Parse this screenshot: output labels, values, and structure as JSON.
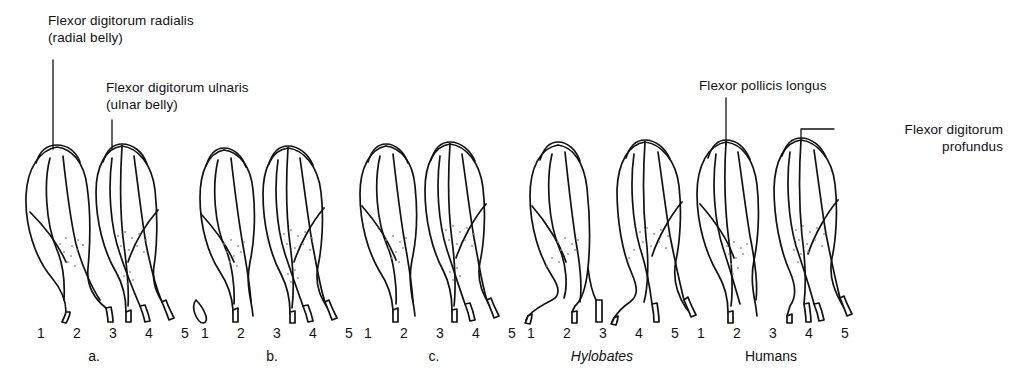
{
  "figure": {
    "background_color": "#ffffff",
    "ink_color": "#111111",
    "stipple_color": "#8d8d8d"
  },
  "annotations": [
    {
      "name": "flexor-digitorum-radialis",
      "line1": "Flexor digitorum radialis",
      "line2": "(radial belly)",
      "align": "left",
      "text_x": 48,
      "text_y": 12,
      "leader": {
        "type": "vertical",
        "x": 53,
        "y1": 60,
        "y2": 149
      }
    },
    {
      "name": "flexor-digitorum-ulnaris",
      "line1": "Flexor digitorum ulnaris",
      "line2": "(ulnar belly)",
      "align": "left",
      "text_x": 106,
      "text_y": 79,
      "leader": {
        "type": "vertical",
        "x": 112,
        "y1": 120,
        "y2": 149
      }
    },
    {
      "name": "flexor-pollicis-longus",
      "line1": "Flexor pollicis longus",
      "line2": "",
      "align": "left",
      "text_x": 699,
      "text_y": 77,
      "leader": {
        "type": "vertical",
        "x": 726,
        "y1": 98,
        "y2": 145
      }
    },
    {
      "name": "flexor-digitorum-profundus",
      "line1": "Flexor digitorum",
      "line2": "profundus",
      "align": "right",
      "text_x": 838,
      "text_y": 121,
      "leader": {
        "type": "elbow",
        "x": 801,
        "y1": 129,
        "y2": 139,
        "x2": 834
      }
    }
  ],
  "groups": [
    {
      "name": "group-a",
      "caption": "a.",
      "caption_italic": false,
      "center_x": 94,
      "digits": [
        "1",
        "2",
        "3",
        "4",
        "5"
      ],
      "digit_y": 325,
      "caption_y": 348,
      "has_detached_tendon": false,
      "radial_belly_tendons": [
        "1",
        "2"
      ],
      "ulnar_belly_tendons": [
        "3",
        "4",
        "5"
      ]
    },
    {
      "name": "group-b",
      "caption": "b.",
      "caption_italic": false,
      "center_x": 272,
      "digits": [
        "1",
        "2",
        "3",
        "4",
        "5"
      ],
      "digit_y": 325,
      "caption_y": 348,
      "has_detached_tendon": true,
      "radial_belly_tendons": [
        "2"
      ],
      "ulnar_belly_tendons": [
        "3",
        "4",
        "5"
      ]
    },
    {
      "name": "group-c",
      "caption": "c.",
      "caption_italic": false,
      "center_x": 434,
      "digits": [
        "1",
        "2",
        "3",
        "4",
        "5"
      ],
      "digit_y": 325,
      "caption_y": 348,
      "has_detached_tendon": false,
      "radial_belly_tendons": [
        "2"
      ],
      "ulnar_belly_tendons": [
        "3",
        "4",
        "5"
      ]
    },
    {
      "name": "group-hylobates",
      "caption": "Hylobates",
      "caption_italic": true,
      "center_x": 602,
      "digits": [
        "1",
        "2",
        "3",
        "4",
        "5"
      ],
      "digit_y": 325,
      "caption_y": 348,
      "has_detached_tendon": false,
      "radial_belly_tendons": [
        "1",
        "2"
      ],
      "ulnar_belly_tendons": [
        "3",
        "4",
        "5"
      ]
    },
    {
      "name": "group-humans",
      "caption": "Humans",
      "caption_italic": false,
      "center_x": 771,
      "digits": [
        "1",
        "2",
        "3",
        "4",
        "5"
      ],
      "digit_y": 325,
      "caption_y": 348,
      "has_detached_tendon": false,
      "radial_belly_tendons": [
        "1",
        "2"
      ],
      "ulnar_belly_tendons": [
        "3",
        "4",
        "5"
      ]
    }
  ]
}
